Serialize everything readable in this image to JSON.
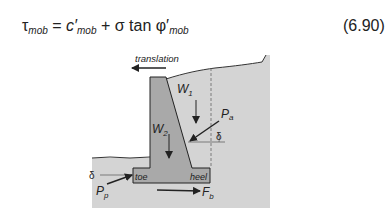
{
  "equation": {
    "lhs": "τ",
    "lhs_sub": "mob",
    "equals": "=",
    "term1": "c′",
    "term1_sub": "mob",
    "plus": "+",
    "term2": "σ tan φ′",
    "term2_sub": "mob",
    "number": "(6.90)"
  },
  "figure": {
    "labels": {
      "translation": "translation",
      "W1": "W",
      "W1_sub": "1",
      "W2": "W",
      "W2_sub": "2",
      "Pa": "P",
      "Pa_sub": "a",
      "delta_a": "δ",
      "delta_p": "δ",
      "Pp": "P",
      "Pp_sub": "p",
      "Fb": "F",
      "Fb_sub": "b",
      "toe": "toe",
      "heel": "heel"
    },
    "colors": {
      "soil": "#d4d4d4",
      "wall": "#a9a9a9",
      "line": "#222222"
    }
  }
}
